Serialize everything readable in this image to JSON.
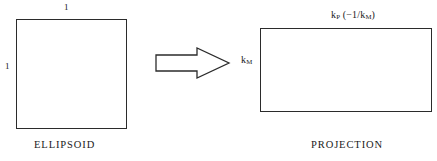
{
  "figure": {
    "background_color": "#ffffff",
    "stroke_color": "#2b2b2b",
    "text_color": "#1a1a1a"
  },
  "ellipsoid": {
    "caption": "ELLIPSOID",
    "top_dimension": "1",
    "left_dimension": "1"
  },
  "arrow": {
    "icon_name": "block-arrow-right-icon",
    "direction": "right"
  },
  "projection": {
    "caption": "PROJECTION",
    "top_label_main": "k",
    "top_label_main_sub": "P",
    "top_label_paren_open": " (−1/k",
    "top_label_paren_sub": "M",
    "top_label_paren_close": ")",
    "left_label_main": "k",
    "left_label_sub": "M"
  }
}
